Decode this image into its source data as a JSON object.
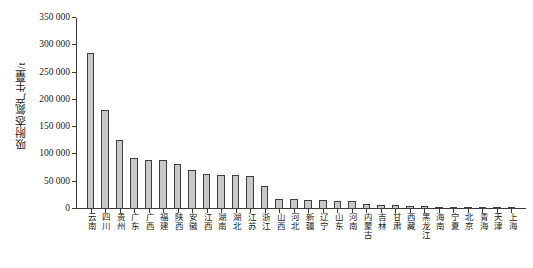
{
  "chart_data": {
    "type": "bar",
    "title": "",
    "subtitle": "",
    "xlabel": "",
    "ylabel": "吸附态氮产生量/t",
    "ylim": [
      0,
      350000
    ],
    "ytick_values": [
      0,
      50000,
      100000,
      150000,
      200000,
      250000,
      300000,
      350000
    ],
    "ytick_labels": [
      "0",
      "50 000",
      "100 000",
      "150 000",
      "200 000",
      "250 000",
      "300 000",
      "350 000"
    ],
    "grid": false,
    "legend": null,
    "legend_position": "none",
    "bar_fill_color": "#c8c8c8",
    "bar_edge_color": "#3f3f3f",
    "axis_color": "#3a3a3a",
    "categories": [
      "云南",
      "四川",
      "贵州",
      "广东",
      "广西",
      "福建",
      "陕西",
      "安徽",
      "江西",
      "湖南",
      "湖北",
      "江苏",
      "浙江",
      "山西",
      "河北",
      "新疆",
      "辽宁",
      "山东",
      "河南",
      "内蒙古",
      "吉林",
      "甘肃",
      "西藏",
      "黑龙江",
      "海南",
      "宁夏",
      "北京",
      "青海",
      "天津",
      "上海"
    ],
    "values": [
      285000,
      181000,
      126000,
      93000,
      90000,
      89000,
      83000,
      72000,
      64000,
      63000,
      62000,
      61000,
      42000,
      19000,
      18000,
      17000,
      16000,
      15000,
      14000,
      9000,
      8000,
      7000,
      6000,
      5000,
      4000,
      3000,
      2500,
      2000,
      1500,
      1200
    ]
  }
}
